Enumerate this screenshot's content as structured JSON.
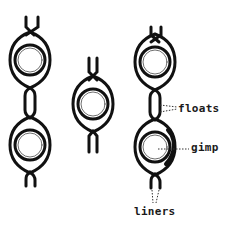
{
  "diagram": {
    "type": "lace-structure-illustration",
    "figures": [
      {
        "id": "left",
        "description": "two gimp-wrapped rings joined by a float section, with liner tails at top and bottom"
      },
      {
        "id": "middle",
        "description": "single gimp-wrapped ring with liner tails at top and bottom"
      },
      {
        "id": "right",
        "description": "two gimp-wrapped rings joined by a float section, annotated"
      }
    ],
    "labels": {
      "floats": "floats",
      "gimp": "gimp",
      "liners": "liners"
    },
    "colors": {
      "ink": "#111111",
      "background": "#ffffff",
      "leader": "#333333"
    }
  }
}
